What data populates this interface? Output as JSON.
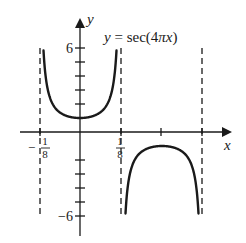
{
  "chart_data": {
    "type": "line",
    "title": "y = sec(4πx)",
    "function": "sec(4*pi*x)",
    "xlabel": "x",
    "ylabel": "y",
    "xlim": [
      -0.1829,
      0.4634
    ],
    "ylim": [
      -7.43,
      8.0
    ],
    "x_ticks": [
      {
        "value": -0.125,
        "label": "-1/8",
        "labeled": true
      },
      {
        "value": 0.125,
        "label": "1/8",
        "labeled": true
      },
      {
        "value": 0.25,
        "label": "",
        "labeled": false
      },
      {
        "value": 0.375,
        "label": "",
        "labeled": false
      }
    ],
    "y_ticks": [
      {
        "value": 6,
        "label": "6",
        "labeled": true
      },
      {
        "value": 5,
        "label": "",
        "labeled": false
      },
      {
        "value": 4,
        "label": "",
        "labeled": false
      },
      {
        "value": 3,
        "label": "",
        "labeled": false
      },
      {
        "value": 2,
        "label": "",
        "labeled": false
      },
      {
        "value": -2,
        "label": "",
        "labeled": false
      },
      {
        "value": -3,
        "label": "",
        "labeled": false
      },
      {
        "value": -4,
        "label": "",
        "labeled": false
      },
      {
        "value": -5,
        "label": "",
        "labeled": false
      },
      {
        "value": -6,
        "label": "-6",
        "labeled": true
      }
    ],
    "vertical_asymptotes": [
      -0.125,
      0.125,
      0.375
    ],
    "branches": [
      {
        "x_range": [
          -0.125,
          0.125
        ],
        "direction": "up",
        "vertex": [
          0,
          1
        ],
        "y_clip": 6
      },
      {
        "x_range": [
          0.125,
          0.375
        ],
        "direction": "down",
        "vertex": [
          0.25,
          -1
        ],
        "y_clip": -6
      }
    ],
    "grid": false,
    "legend": null,
    "annotations": [
      {
        "text": "y = sec(4πx)",
        "position": "top-right of y-axis"
      }
    ]
  },
  "labels": {
    "x_axis": "x",
    "y_axis": "y",
    "equation_lhs": "y",
    "equation_eq": " = sec(4",
    "equation_pi": "π",
    "equation_x": "x",
    "equation_rp": ")",
    "x_neg_eighth_sign": "−",
    "x_eighth_num": "1",
    "x_eighth_den": "8",
    "y_top": "6",
    "y_bottom": "−6"
  },
  "style": {
    "stroke": "#1a1a1a",
    "background": "#ffffff"
  }
}
